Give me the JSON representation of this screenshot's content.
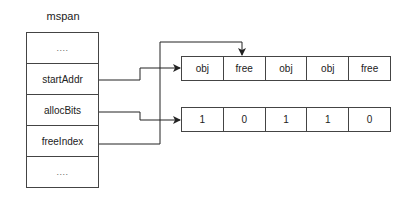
{
  "title": "mspan",
  "mspan_fields": [
    {
      "label": "...."
    },
    {
      "label": "startAddr"
    },
    {
      "label": "allocBits"
    },
    {
      "label": "freeIndex"
    },
    {
      "label": "...."
    }
  ],
  "objects": [
    {
      "label": "obj"
    },
    {
      "label": "free"
    },
    {
      "label": "obj"
    },
    {
      "label": "obj"
    },
    {
      "label": "free"
    }
  ],
  "alloc_bits": [
    {
      "label": "1"
    },
    {
      "label": "0"
    },
    {
      "label": "1"
    },
    {
      "label": "1"
    },
    {
      "label": "0"
    }
  ],
  "edges": [
    {
      "from": "startAddr",
      "to": "objects[0]"
    },
    {
      "from": "allocBits",
      "to": "alloc_bits[0]"
    },
    {
      "from": "freeIndex",
      "to": "objects[1]"
    }
  ]
}
